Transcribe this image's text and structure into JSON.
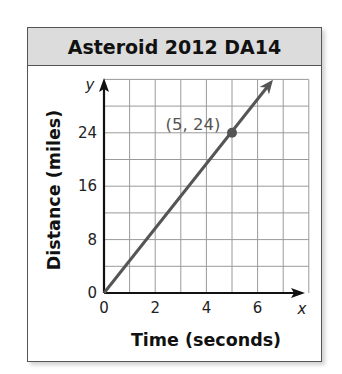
{
  "chart_data": {
    "type": "line",
    "title": "Asteroid 2012 DA14",
    "xlabel": "Time (seconds)",
    "ylabel": "Distance (miles)",
    "x_var": "x",
    "y_var": "y",
    "x_ticks": [
      "0",
      "2",
      "4",
      "6"
    ],
    "y_ticks": [
      "0",
      "8",
      "16",
      "24"
    ],
    "xlim": [
      0,
      8
    ],
    "ylim": [
      0,
      32
    ],
    "grid": true,
    "grid_step_x": 1,
    "grid_step_y": 4,
    "series": [
      {
        "name": "Asteroid distance",
        "x": [
          0,
          5,
          6.7
        ],
        "y": [
          0,
          24,
          32.2
        ],
        "color": "#555555"
      }
    ],
    "points": [
      {
        "x": 5,
        "y": 24,
        "label": "(5, 24)"
      }
    ],
    "annotations": [
      "(5, 24)"
    ]
  },
  "colors": {
    "header_bg": "#dcdcdc",
    "line": "#555555",
    "grid": "#9a9a9a",
    "axis": "#111111"
  }
}
